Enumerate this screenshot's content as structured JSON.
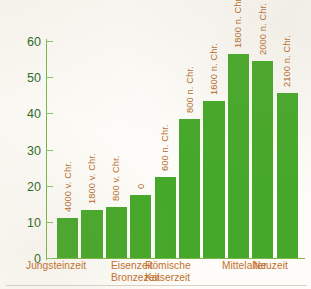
{
  "chart_data": {
    "type": "bar",
    "title": "",
    "xlabel": "",
    "ylabel": "",
    "ylim": [
      0,
      60
    ],
    "ytick_values": [
      0,
      10,
      20,
      30,
      40,
      50,
      60
    ],
    "ytick_labels": [
      "0",
      "10",
      "20",
      "30",
      "40",
      "50",
      "60"
    ],
    "grid": false,
    "legend": "none",
    "categories": [
      "4000 v. Chr.",
      "1800 v. Chr.",
      "800 v. Chr.",
      "0",
      "600 n. Chr.",
      "800 n. Chr.",
      "1600 n. Chr.",
      "1800 n. Chr.",
      "2000 n. Chr.",
      "2100 n. Chr."
    ],
    "bars": [
      {
        "label": "4000 v. Chr.",
        "value": 11.2
      },
      {
        "label": "1800 v. Chr.",
        "value": 13.2
      },
      {
        "label": "800 v. Chr.",
        "value": 14.2
      },
      {
        "label": "0",
        "value": 17.3
      },
      {
        "label": "600 n. Chr.",
        "value": 22.3
      },
      {
        "label": "800 n. Chr.",
        "value": 38.4
      },
      {
        "label": "1600 n. Chr.",
        "value": 43.3
      },
      {
        "label": "1800 n. Chr.",
        "value": 56.5
      },
      {
        "label": "2000 n. Chr.",
        "value": 54.4
      },
      {
        "label": "2100 n. Chr.",
        "value": 45.5
      }
    ],
    "era_labels": [
      {
        "line1": "Jungsteinzeit",
        "line2": ""
      },
      {
        "line1": "Eisenzeit",
        "line2": "Bronzezeit"
      },
      {
        "line1": "Römische",
        "line2": "Kaiserzeit"
      },
      {
        "line1": "Mittelalter",
        "line2": ""
      },
      {
        "line1": "Neuzeit",
        "line2": ""
      }
    ],
    "colors": {
      "bar": "#46a82a",
      "axis": "#7ab648",
      "ytick_text": "#2f6b2a",
      "bar_label_text": "#b5692a",
      "category_text": "#c2702c",
      "background": "#fdfcf8"
    }
  }
}
